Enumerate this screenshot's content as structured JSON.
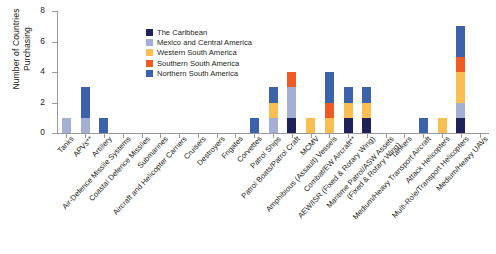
{
  "chart_data": {
    "type": "bar",
    "subtype": "stacked-bar",
    "title": "",
    "xlabel": "",
    "ylabel": "Number of Countries\nPurchasing",
    "ylim": [
      0,
      8
    ],
    "yticks": [
      0,
      2,
      4,
      6,
      8
    ],
    "grid": false,
    "legend_position": "inside-top-left",
    "categories": [
      "Tanks",
      "APVs**",
      "Artillery",
      "Air-Defence Missile Systems",
      "Coastal Defence Missiles",
      "Submarines",
      "Aircraft and Helicopter Carriers",
      "Cruisers",
      "Destroyers",
      "Frigates",
      "Corvettes",
      "Patrol Ships",
      "Patrol Boats/Patrol Craft",
      "MCMV",
      "Amphibious (Assault) Vessels",
      "Combat/EW Aircraft**",
      "AEW/ISR (Fixed & Rotary Wing)",
      "Maritime Patrol/ASW Assets\n(Fixed & Rotary Wing)",
      "Tankers",
      "Medium/Heavy Transport Aircraft",
      "Attack Helicopters",
      "Multi-Role/Transport Helicopters",
      "Medium/Heavy UAVs"
    ],
    "series": [
      {
        "name": "The Caribbean",
        "color": "#1f2259",
        "values": [
          0,
          0,
          0,
          0,
          0,
          0,
          0,
          0,
          0,
          0,
          0,
          0,
          1,
          0,
          0,
          1,
          1,
          0,
          0,
          0,
          0,
          1,
          0
        ]
      },
      {
        "name": "Mexico and Central America",
        "color": "#a3b0d4",
        "values": [
          1,
          1,
          0,
          0,
          0,
          0,
          0,
          0,
          0,
          0,
          0,
          1,
          2,
          0,
          0,
          0,
          0,
          0,
          0,
          0,
          0,
          1,
          0
        ]
      },
      {
        "name": "Western South America",
        "color": "#fbbe50",
        "values": [
          0,
          0,
          0,
          0,
          0,
          0,
          0,
          0,
          0,
          0,
          0,
          1,
          0,
          1,
          1,
          1,
          1,
          0,
          0,
          0,
          1,
          2,
          0
        ]
      },
      {
        "name": "Southern South America",
        "color": "#f15a22",
        "values": [
          0,
          0,
          0,
          0,
          0,
          0,
          0,
          0,
          0,
          0,
          0,
          0,
          1,
          0,
          1,
          0,
          0,
          0,
          0,
          0,
          0,
          1,
          0
        ]
      },
      {
        "name": "Northern South America",
        "color": "#3c62ab",
        "values": [
          0,
          2,
          1,
          0,
          0,
          0,
          0,
          0,
          0,
          0,
          1,
          1,
          0,
          0,
          2,
          1,
          1,
          0,
          0,
          1,
          0,
          2,
          0
        ]
      }
    ],
    "totals": [
      1,
      3,
      1,
      0,
      0,
      0,
      0,
      0,
      0,
      0,
      1,
      3,
      4,
      1,
      4,
      3,
      3,
      0,
      0,
      1,
      1,
      7,
      0
    ]
  },
  "legend": {
    "items": [
      {
        "label": "The Caribbean",
        "color": "#1f2259"
      },
      {
        "label": "Mexico and Central America",
        "color": "#a3b0d4"
      },
      {
        "label": "Western South America",
        "color": "#fbbe50"
      },
      {
        "label": "Southern South America",
        "color": "#f15a22"
      },
      {
        "label": "Northern South America",
        "color": "#3c62ab"
      }
    ]
  },
  "axis": {
    "y_title": "Number of Countries\nPurchasing",
    "y_tick_labels": [
      "0",
      "2",
      "4",
      "6",
      "8"
    ]
  }
}
